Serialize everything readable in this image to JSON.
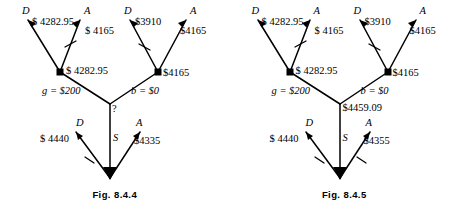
{
  "page": {
    "background_color": "#ffffff",
    "ink_color": "#000000"
  },
  "figures": [
    {
      "id": "fig-8-4-4",
      "caption": "Fig. 8.4.4",
      "root": {
        "label": "?",
        "value_text": "?"
      },
      "branch_labels": [
        {
          "name": "g",
          "text": "g = $200"
        },
        {
          "name": "b",
          "text": "b = $0"
        }
      ],
      "chance_nodes": [
        {
          "name": "left-chance-node",
          "value": "$ 4282.95"
        },
        {
          "name": "right-chance-node",
          "value": "$4165"
        }
      ],
      "terminals": [
        {
          "name": "left-D",
          "letter": "D",
          "value": "$ 4282.95"
        },
        {
          "name": "left-A",
          "letter": "A",
          "value": "$ 4165"
        },
        {
          "name": "right-D",
          "letter": "D",
          "value": "$3910"
        },
        {
          "name": "right-A",
          "letter": "A",
          "value": "$4165"
        }
      ],
      "bottom_branch": {
        "stem_letter": "S",
        "left": {
          "letter": "D",
          "value": "$ 4440"
        },
        "right": {
          "letter": "A",
          "value": "$4335"
        }
      }
    },
    {
      "id": "fig-8-4-5",
      "caption": "Fig. 8.4.5",
      "root": {
        "label": "$4459.09",
        "value_text": "$4459.09"
      },
      "branch_labels": [
        {
          "name": "g",
          "text": "g = $200"
        },
        {
          "name": "b",
          "text": "b = $0"
        }
      ],
      "chance_nodes": [
        {
          "name": "left-chance-node",
          "value": "$ 4282.95"
        },
        {
          "name": "right-chance-node",
          "value": "$4165"
        }
      ],
      "terminals": [
        {
          "name": "left-D",
          "letter": "D",
          "value": "$ 4282.95"
        },
        {
          "name": "left-A",
          "letter": "A",
          "value": "$ 4165"
        },
        {
          "name": "right-D",
          "letter": "D",
          "value": "$3910"
        },
        {
          "name": "right-A",
          "letter": "A",
          "value": "$4165"
        }
      ],
      "bottom_branch": {
        "stem_letter": "S",
        "left": {
          "letter": "D",
          "value": "$ 4440"
        },
        "right": {
          "letter": "A",
          "value": "$4355"
        }
      }
    }
  ]
}
